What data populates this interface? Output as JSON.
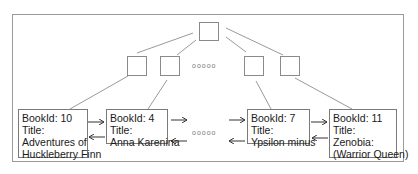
{
  "diagram": {
    "type": "B+ tree with linked leaf nodes",
    "ellipsis": "ooooo",
    "root": {
      "label": ""
    },
    "internal_nodes": [
      {
        "label": ""
      },
      {
        "label": ""
      },
      {
        "label": ""
      },
      {
        "label": ""
      }
    ],
    "leaves": [
      {
        "bookid": "BookId: 10",
        "title_label": "Title:",
        "title_line1": "Adventures of",
        "title_line2": "Huckleberry Finn"
      },
      {
        "bookid": "BookId: 4",
        "title_label": "Title:",
        "title_line1": "Anna Karenina",
        "title_line2": ""
      },
      {
        "bookid": "BookId: 7",
        "title_label": "Title:",
        "title_line1": "Ypsilon minus",
        "title_line2": ""
      },
      {
        "bookid": "BookId: 11",
        "title_label": "Title:",
        "title_line1": "Zenobia:",
        "title_line2": "(Warrior Queen)"
      }
    ],
    "colors": {
      "border": "#8a8a8a",
      "text": "#1a1a1a",
      "line": "#9a9a9a"
    }
  }
}
